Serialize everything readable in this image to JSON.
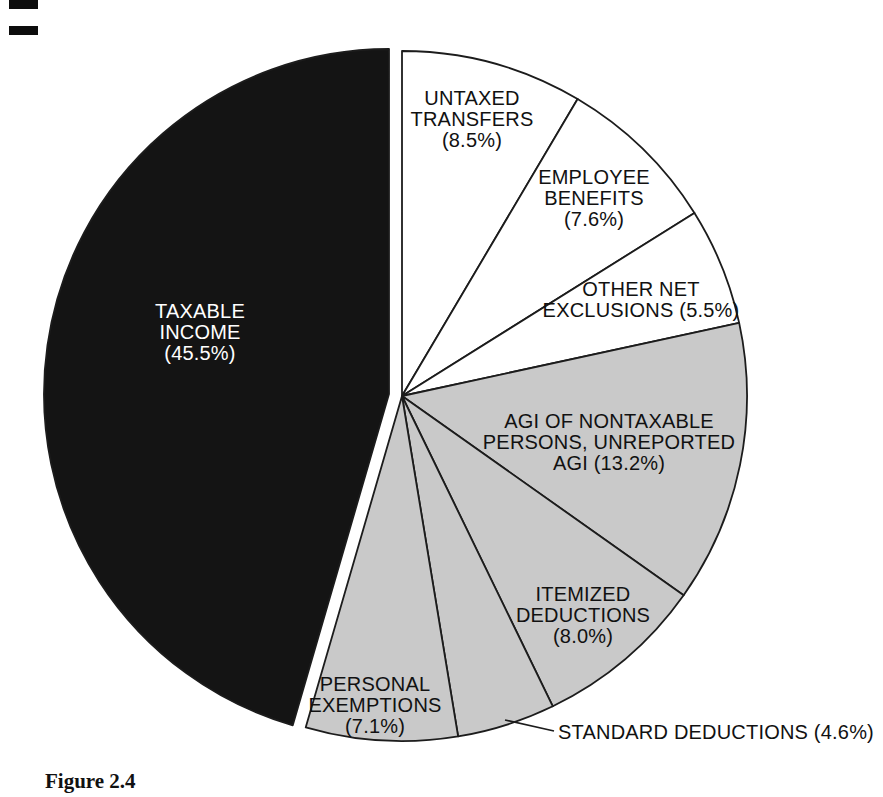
{
  "figure": {
    "caption": "Figure 2.4"
  },
  "chart_data": {
    "type": "pie",
    "title": "",
    "start_angle_deg_from_12_oclock": 0,
    "direction": "clockwise",
    "unit": "percent",
    "colors": {
      "white_slice": "#ffffff",
      "gray_slice": "#c9c9c9",
      "black_slice": "#141414",
      "outline": "#1c1c1c",
      "label_dark": "#111111",
      "label_light": "#ffffff"
    },
    "slices": [
      {
        "name": "untaxed-transfers",
        "label": "UNTAXED\nTRANSFERS\n(8.5%)",
        "value": 8.5,
        "fill": "#ffffff",
        "text_color": "#111111"
      },
      {
        "name": "employee-benefits",
        "label": "EMPLOYEE\nBENEFITS\n(7.6%)",
        "value": 7.6,
        "fill": "#ffffff",
        "text_color": "#111111"
      },
      {
        "name": "other-net-exclusions",
        "label": "OTHER NET\nEXCLUSIONS (5.5%)",
        "value": 5.5,
        "fill": "#ffffff",
        "text_color": "#111111"
      },
      {
        "name": "agi-nontaxable",
        "label": "AGI OF NONTAXABLE\nPERSONS, UNREPORTED\nAGI (13.2%)",
        "value": 13.2,
        "fill": "#c9c9c9",
        "text_color": "#111111"
      },
      {
        "name": "itemized-deductions",
        "label": "ITEMIZED\nDEDUCTIONS\n(8.0%)",
        "value": 8.0,
        "fill": "#c9c9c9",
        "text_color": "#111111"
      },
      {
        "name": "standard-deductions",
        "label": "STANDARD DEDUCTIONS (4.6%)",
        "value": 4.6,
        "fill": "#c9c9c9",
        "text_color": "#111111",
        "label_outside": true
      },
      {
        "name": "personal-exemptions",
        "label": "PERSONAL\nEXEMPTIONS\n(7.1%)",
        "value": 7.1,
        "fill": "#c9c9c9",
        "text_color": "#111111"
      },
      {
        "name": "taxable-income",
        "label": "TAXABLE\nINCOME\n(45.5%)",
        "value": 45.5,
        "fill": "#141414",
        "text_color": "#ffffff",
        "exploded": true
      }
    ]
  }
}
